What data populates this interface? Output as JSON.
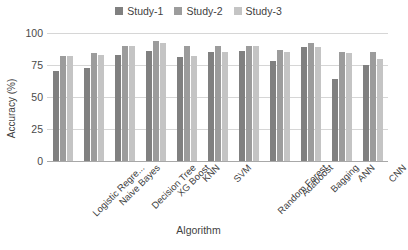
{
  "chart_data": {
    "type": "bar",
    "title": "",
    "xlabel": "Algorithm",
    "ylabel": "Accuracy (%)",
    "ylim": [
      0,
      100
    ],
    "yticks": [
      0,
      25,
      50,
      75,
      100
    ],
    "grid": true,
    "legend_position": "top-center",
    "categories": [
      "Logistic Regre...",
      "Naive Bayes",
      "Decision Tree",
      "XG Boost",
      "KNN",
      "SVM",
      "Random Forest",
      "Adaboost",
      "Bagging",
      "ANN",
      "CNN"
    ],
    "series": [
      {
        "name": "Study-1",
        "color": "#808080",
        "values": [
          70,
          73,
          83,
          86,
          81,
          85,
          86,
          78,
          89,
          64,
          75
        ]
      },
      {
        "name": "Study-2",
        "color": "#9c9c9c",
        "values": [
          82,
          84,
          90,
          94,
          90,
          90,
          90,
          87,
          92,
          85,
          85
        ]
      },
      {
        "name": "Study-3",
        "color": "#c4c4c4",
        "values": [
          82,
          83,
          90,
          92,
          82,
          85,
          90,
          85,
          89,
          84,
          80
        ]
      }
    ]
  },
  "colors": {
    "gridline": "#d6d6d6",
    "axis": "#a8a8a8",
    "text": "#3f3f3f",
    "background": "#ffffff"
  }
}
